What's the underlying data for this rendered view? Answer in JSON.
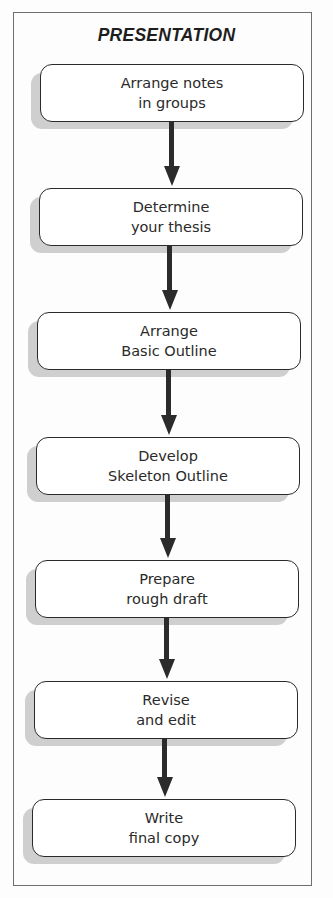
{
  "diagram": {
    "title": "PRESENTATION",
    "type": "vertical flowchart",
    "steps": [
      {
        "line1": "Arrange notes",
        "line2": "in groups"
      },
      {
        "line1": "Determine",
        "line2": "your thesis"
      },
      {
        "line1": "Arrange",
        "line2": "Basic Outline"
      },
      {
        "line1": "Develop",
        "line2": "Skeleton Outline"
      },
      {
        "line1": "Prepare",
        "line2": "rough draft"
      },
      {
        "line1": "Revise",
        "line2": "and edit"
      },
      {
        "line1": "Write",
        "line2": "final copy"
      }
    ],
    "edges": [
      {
        "from": 0,
        "to": 1
      },
      {
        "from": 1,
        "to": 2
      },
      {
        "from": 2,
        "to": 3
      },
      {
        "from": 3,
        "to": 4
      },
      {
        "from": 4,
        "to": 5
      },
      {
        "from": 5,
        "to": 6
      }
    ]
  }
}
